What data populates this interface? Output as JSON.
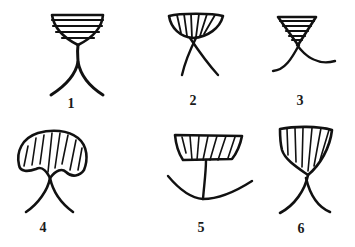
{
  "figure": {
    "stroke_color": "#111111",
    "background": "#ffffff",
    "items": [
      {
        "label": "1",
        "shape": "goblet with horizontal hatching on two curved legs"
      },
      {
        "label": "2",
        "shape": "bowl with vertical hatching on crossed legs"
      },
      {
        "label": "3",
        "shape": "inverted triangle with horizontal hatching on curved legs"
      },
      {
        "label": "4",
        "shape": "mushroom cap with vertical hatching on curved legs"
      },
      {
        "label": "5",
        "shape": "bowl with vertical hatching on stem above arc"
      },
      {
        "label": "6",
        "shape": "tilted cup with vertical hatching on curved legs"
      }
    ]
  }
}
